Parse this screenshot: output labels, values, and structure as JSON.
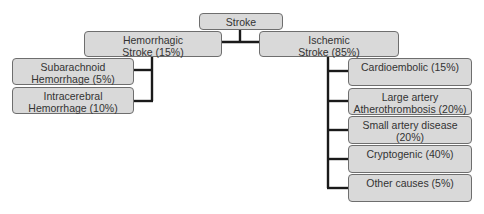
{
  "diagram": {
    "root": {
      "label": "Stroke"
    },
    "branches": [
      {
        "label": "Hemorrhagic\nStroke (15%)",
        "children": [
          {
            "label": "Subarachnoid\nHemorrhage (5%)"
          },
          {
            "label": "Intracerebral\nHemorrhage (10%)"
          }
        ]
      },
      {
        "label": "Ischemic\nStroke (85%)",
        "children": [
          {
            "label": "Cardioembolic (15%)"
          },
          {
            "label": "Large artery\nAtherothrombosis (20%)"
          },
          {
            "label": "Small artery disease (20%)"
          },
          {
            "label": "Cryptogenic (40%)"
          },
          {
            "label": "Other causes (5%)"
          }
        ]
      }
    ]
  }
}
